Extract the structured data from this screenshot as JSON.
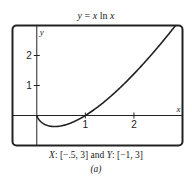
{
  "chart_data": {
    "type": "line",
    "title": "y = x ln x",
    "title_parts": {
      "lhs": "y",
      "eq": " = ",
      "x1": "x",
      "ln": " ln ",
      "x2": "x"
    },
    "xlabel": "x",
    "ylabel": "y",
    "xlim": [
      -0.5,
      3
    ],
    "ylim": [
      -1,
      3
    ],
    "x_ticks": [
      1,
      2
    ],
    "x_tick_labels": [
      "1",
      "2"
    ],
    "y_ticks": [
      1,
      2
    ],
    "y_tick_labels": [
      "1",
      "2"
    ],
    "grid": false,
    "function": "x*ln(x)",
    "domain": [
      0,
      3
    ],
    "series": [
      {
        "name": "y = x ln x",
        "x": [
          0,
          0.05,
          0.1,
          0.2,
          0.3,
          0.368,
          0.5,
          0.7,
          1.0,
          1.3,
          1.6,
          2.0,
          2.4,
          2.8,
          2.95
        ],
        "y": [
          0,
          -0.15,
          -0.23,
          -0.32,
          -0.36,
          -0.368,
          -0.35,
          -0.25,
          0,
          0.34,
          0.75,
          1.39,
          2.1,
          2.88,
          3.0
        ]
      }
    ],
    "window_caption": "X: [−.5, 3] and Y: [−1, 3]",
    "caption_parts": {
      "x_var": "X",
      "x_range": ": [−.5, 3] and ",
      "y_var": "Y",
      "y_range": ": [−1, 3]"
    },
    "sublabel": "(a)"
  }
}
